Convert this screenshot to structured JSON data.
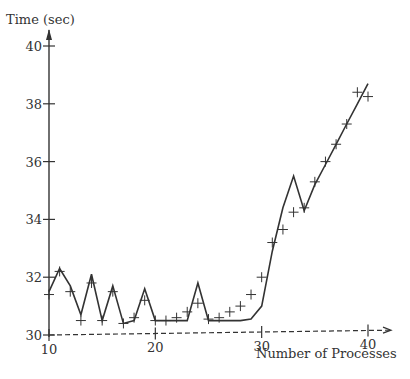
{
  "chart_data": {
    "type": "line",
    "title": "",
    "xlabel": "Number of Processes",
    "ylabel": "Time (sec)",
    "xlim": [
      10,
      40
    ],
    "ylim": [
      30,
      40
    ],
    "xticks": [
      10,
      20,
      30,
      40
    ],
    "yticks": [
      30,
      32,
      34,
      36,
      38,
      40
    ],
    "grid": false,
    "legend": null,
    "series": [
      {
        "name": "predicted",
        "style": "solid-line",
        "x": [
          10,
          11,
          12,
          13,
          14,
          15,
          16,
          17,
          18,
          19,
          20,
          21,
          22,
          23,
          24,
          25,
          26,
          27,
          28,
          29,
          30,
          31,
          32,
          33,
          34,
          35,
          36,
          37,
          38,
          39,
          40
        ],
        "y": [
          31.5,
          32.3,
          31.7,
          30.7,
          32.1,
          30.5,
          31.7,
          30.4,
          30.5,
          31.6,
          30.5,
          30.5,
          30.5,
          30.5,
          31.8,
          30.5,
          30.5,
          30.5,
          30.5,
          30.55,
          31.0,
          32.9,
          34.4,
          35.5,
          34.3,
          35.2,
          35.9,
          36.6,
          37.3,
          38.0,
          38.7
        ]
      },
      {
        "name": "measured",
        "style": "plus-markers",
        "x": [
          10,
          11,
          12,
          13,
          14,
          15,
          16,
          17,
          18,
          19,
          20,
          21,
          22,
          23,
          24,
          25,
          26,
          27,
          28,
          29,
          30,
          31,
          32,
          33,
          34,
          35,
          36,
          37,
          38,
          39,
          40
        ],
        "y": [
          31.4,
          32.2,
          31.5,
          30.5,
          31.8,
          30.5,
          31.5,
          30.4,
          30.6,
          31.2,
          30.5,
          30.5,
          30.6,
          30.8,
          31.1,
          30.55,
          30.6,
          30.8,
          31.0,
          31.4,
          32.0,
          33.2,
          33.65,
          34.25,
          34.4,
          35.3,
          36.0,
          36.6,
          37.3,
          38.4,
          38.25
        ]
      },
      {
        "name": "baseline",
        "style": "dashed-line",
        "x": [
          10,
          40
        ],
        "y": [
          30.0,
          30.15
        ]
      }
    ]
  },
  "labels": {
    "ylabel": "Time (sec)",
    "xlabel": "Number of Processes",
    "yticks": [
      "30",
      "32",
      "34",
      "36",
      "38",
      "40"
    ],
    "xticks": [
      "10",
      "20",
      "30",
      "40"
    ]
  },
  "colors": {
    "ink": "#333333",
    "background": "#ffffff"
  }
}
